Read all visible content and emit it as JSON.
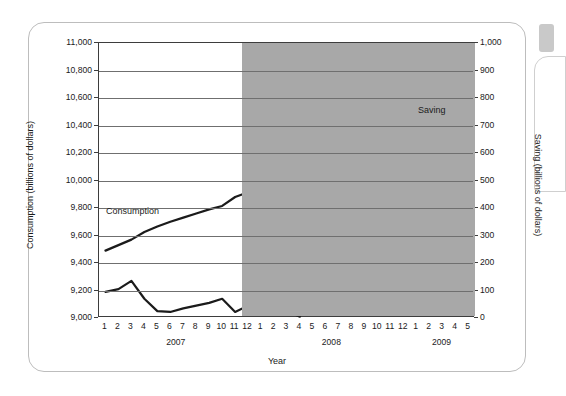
{
  "chart_data": {
    "type": "line",
    "title": "",
    "xlabel": "Year",
    "ylabel": "Consumption (billions of dollars)",
    "ylabel_right": "Saving (billions of dollars)",
    "ylim": [
      9000,
      11000
    ],
    "ylim_right": [
      0,
      1000
    ],
    "ytick_step": 200,
    "ytick_step_right": 100,
    "grid": true,
    "legend_position": "inline-annotation",
    "x": [
      "1",
      "2",
      "3",
      "4",
      "5",
      "6",
      "7",
      "8",
      "9",
      "10",
      "11",
      "12",
      "1",
      "2",
      "3",
      "4",
      "5",
      "6",
      "7",
      "8",
      "9",
      "10",
      "11",
      "12",
      "1",
      "2",
      "3",
      "4",
      "5"
    ],
    "year_groups": [
      {
        "label": "2007",
        "start_index": 0,
        "end_index": 11
      },
      {
        "label": "2008",
        "start_index": 12,
        "end_index": 23
      },
      {
        "label": "2009",
        "start_index": 24,
        "end_index": 28
      }
    ],
    "yticks_left": [
      "11,000",
      "10,800",
      "10,600",
      "10,400",
      "10,200",
      "10,000",
      "9,800",
      "9,600",
      "9,400",
      "9,200",
      "9,000"
    ],
    "yticks_right": [
      "1,000",
      "900",
      "800",
      "700",
      "600",
      "500",
      "400",
      "300",
      "200",
      "100",
      "0"
    ],
    "series": [
      {
        "name": "Consumption",
        "axis": "left",
        "color": "#1b1b1b",
        "values": [
          9490,
          9530,
          9570,
          9625,
          9665,
          9700,
          9730,
          9760,
          9790,
          9815,
          9880,
          9915,
          9970,
          9975,
          10010,
          10065,
          10110,
          10185,
          10190,
          10165,
          10140,
          10075,
          9985,
          9900,
          9930,
          9890,
          9930,
          9935,
          9940
        ]
      },
      {
        "name": "Saving",
        "axis": "right",
        "color": "#1b1b1b",
        "values": [
          95,
          105,
          135,
          70,
          25,
          22,
          35,
          45,
          55,
          70,
          22,
          45,
          15,
          45,
          25,
          5,
          530,
          350,
          230,
          95,
          155,
          230,
          300,
          405,
          490,
          455,
          485,
          610,
          770
        ]
      }
    ],
    "shaded_region": {
      "label": "recession",
      "color": "#a8a8a8",
      "start_index": 11,
      "end_index": 28
    },
    "annotations": [
      {
        "text": "Consumption",
        "kind": "series-label"
      },
      {
        "text": "Saving",
        "kind": "series-label"
      },
      {
        "text": "",
        "kind": "arrow-down",
        "note": "arrow pointing down-right at consumption decline"
      },
      {
        "text": "",
        "kind": "arrow-up",
        "note": "arrow pointing up-right at saving rise"
      }
    ]
  },
  "axis": {
    "left_title": "Consumption (billions of dollars)",
    "right_title": "Saving (billions of dollars)",
    "x_title": "Year"
  },
  "labels": {
    "consumption": "Consumption",
    "saving": "Saving"
  },
  "colors": {
    "line": "#1b1b1b",
    "recession_shade": "#a8a8a8",
    "grid": "#6f6f6f",
    "axis": "#3d3d3d"
  }
}
